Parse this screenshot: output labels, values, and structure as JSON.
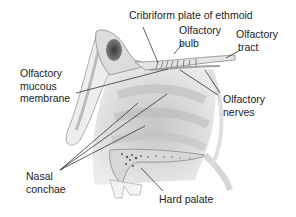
{
  "diagram": {
    "labels": {
      "cribriform": "Cribriform plate of ethmoid",
      "bulb_1": "Olfactory",
      "bulb_2": "bulb",
      "tract_1": "Olfactory",
      "tract_2": "tract",
      "mucous_1": "Olfactory",
      "mucous_2": "mucous",
      "mucous_3": "membrane",
      "nerves_1": "Olfactory",
      "nerves_2": "nerves",
      "conchae_1": "Nasal",
      "conchae_2": "conchae",
      "palate": "Hard palate"
    },
    "colors": {
      "line": "#333333",
      "tissue": "#e6e6e6",
      "shade": "#c8c8c8",
      "sinus": "#555555"
    }
  }
}
